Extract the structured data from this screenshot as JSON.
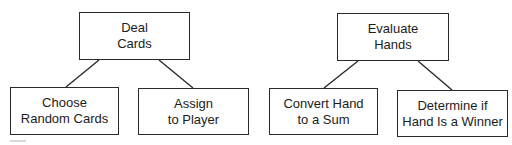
{
  "diagram": {
    "type": "hierarchy-chart",
    "trees": [
      {
        "root": {
          "id": "deal",
          "lines": [
            "Deal",
            "Cards"
          ]
        },
        "children": [
          {
            "id": "choose",
            "lines": [
              "Choose",
              "Random Cards"
            ]
          },
          {
            "id": "assign",
            "lines": [
              "Assign",
              "to Player"
            ]
          }
        ]
      },
      {
        "root": {
          "id": "evaluate",
          "lines": [
            "Evaluate",
            "Hands"
          ]
        },
        "children": [
          {
            "id": "convert",
            "lines": [
              "Convert Hand",
              "to a Sum"
            ]
          },
          {
            "id": "determine",
            "lines": [
              "Determine if",
              "Hand Is a Winner"
            ]
          }
        ]
      }
    ],
    "edges": [
      {
        "from": "deal",
        "to": "choose"
      },
      {
        "from": "deal",
        "to": "assign"
      },
      {
        "from": "evaluate",
        "to": "convert"
      },
      {
        "from": "evaluate",
        "to": "determine"
      }
    ],
    "colors": {
      "stroke": "#2a2a2a",
      "text": "#1c1c1c",
      "background": "#ffffff"
    }
  }
}
